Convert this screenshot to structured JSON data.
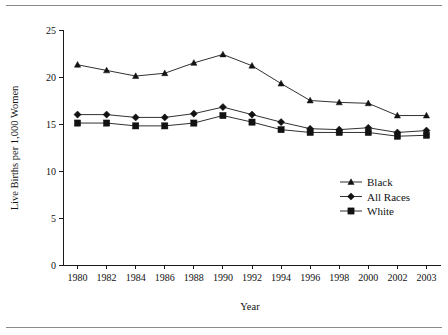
{
  "figure": {
    "has_top_rule": true,
    "has_bottom_rule": true,
    "rule_color": "#8a8a8a",
    "background": "#ffffff",
    "ink_color": "#121212"
  },
  "chart_data": {
    "type": "line",
    "title": "",
    "subtitle": "",
    "xlabel": "Year",
    "ylabel": "Live Births per 1,000 Women",
    "categories": [
      "1980",
      "1982",
      "1984",
      "1986",
      "1988",
      "1990",
      "1992",
      "1994",
      "1996",
      "1998",
      "2000",
      "2002",
      "2003"
    ],
    "x": [
      1980,
      1982,
      1984,
      1986,
      1988,
      1990,
      1992,
      1994,
      1996,
      1998,
      2000,
      2002,
      2003
    ],
    "ylim": [
      0,
      25
    ],
    "yticks": [
      0,
      5,
      10,
      15,
      20,
      25
    ],
    "ytick_labels": [
      "0",
      "5",
      "10",
      "15",
      "20",
      "25"
    ],
    "grid": false,
    "legend_position": "center-right",
    "series": [
      {
        "name": "Black",
        "marker": "triangle",
        "values": [
          21.3,
          20.7,
          20.1,
          20.4,
          21.5,
          22.4,
          21.2,
          19.3,
          17.5,
          17.3,
          17.2,
          15.9,
          15.9
        ]
      },
      {
        "name": "All Races",
        "marker": "diamond",
        "values": [
          16.0,
          16.0,
          15.7,
          15.7,
          16.1,
          16.8,
          16.0,
          15.2,
          14.5,
          14.4,
          14.6,
          14.1,
          14.3
        ]
      },
      {
        "name": "White",
        "marker": "square",
        "values": [
          15.1,
          15.1,
          14.8,
          14.8,
          15.1,
          15.9,
          15.2,
          14.4,
          14.1,
          14.1,
          14.1,
          13.7,
          13.8
        ]
      }
    ]
  },
  "legend": {
    "items": [
      {
        "label": "Black",
        "marker": "triangle"
      },
      {
        "label": "All Races",
        "marker": "diamond"
      },
      {
        "label": "White",
        "marker": "square"
      }
    ]
  }
}
